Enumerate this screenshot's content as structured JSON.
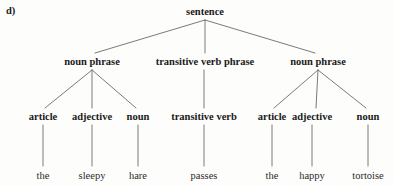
{
  "figure": {
    "part_label": "d)",
    "background_color": "#fdfdfc",
    "line_color": "#6b6b6b",
    "text_color": "#1a1a1a"
  },
  "tree": {
    "root": {
      "label": "sentence",
      "x": 205,
      "y": 12
    },
    "phrases": [
      {
        "label": "noun phrase",
        "x": 92,
        "y": 62
      },
      {
        "label": "transitive verb phrase",
        "x": 205,
        "y": 62
      },
      {
        "label": "noun phrase",
        "x": 318,
        "y": 62
      }
    ],
    "categories": [
      {
        "label": "article",
        "x": 43,
        "y": 117
      },
      {
        "label": "adjective",
        "x": 92,
        "y": 117
      },
      {
        "label": "noun",
        "x": 138,
        "y": 117
      },
      {
        "label": "transitive verb",
        "x": 204,
        "y": 117
      },
      {
        "label": "article",
        "x": 272,
        "y": 117
      },
      {
        "label": "adjective",
        "x": 312,
        "y": 117
      },
      {
        "label": "noun",
        "x": 368,
        "y": 117
      }
    ],
    "words": [
      {
        "label": "the",
        "x": 43,
        "y": 176
      },
      {
        "label": "sleepy",
        "x": 92,
        "y": 176
      },
      {
        "label": "hare",
        "x": 138,
        "y": 176
      },
      {
        "label": "passes",
        "x": 204,
        "y": 176
      },
      {
        "label": "the",
        "x": 272,
        "y": 176
      },
      {
        "label": "happy",
        "x": 312,
        "y": 176
      },
      {
        "label": "tortoise",
        "x": 368,
        "y": 176
      }
    ],
    "sentence_text": "the sleepy hare passes the happy tortoise"
  }
}
